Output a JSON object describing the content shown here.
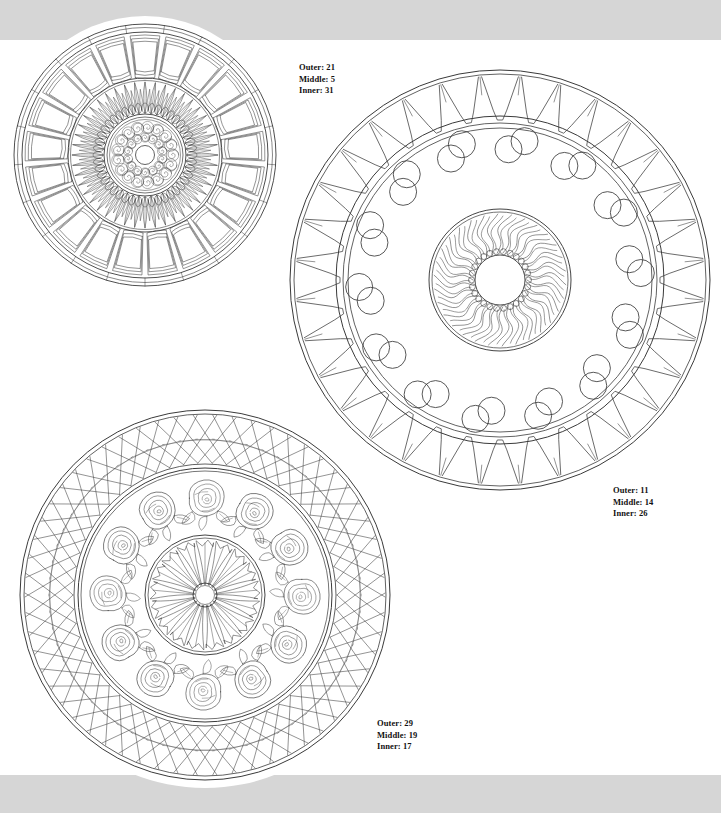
{
  "page": {
    "width": 721,
    "height": 813,
    "background_color": "#d6d6d6",
    "paper_color": "#ffffff",
    "ink_color": "#3a3a3a"
  },
  "mandalas": [
    {
      "id": "mandala-top-left",
      "position": {
        "x": 12,
        "y": 22,
        "size": 266
      },
      "style": "rosette-petal-arches",
      "rings": {
        "outer": {
          "count": 21,
          "motif": "rounded-arch-petals"
        },
        "middle": {
          "count": 5,
          "motif": "radiating-leaf-flames"
        },
        "inner": {
          "count": 31,
          "motif": "spiral-scrolls"
        }
      },
      "label": {
        "outer_label": "Outer: 21",
        "middle_label": "Middle: 5",
        "inner_label": "Inner: 31"
      }
    },
    {
      "id": "mandala-top-right",
      "position": {
        "x": 288,
        "y": 68,
        "size": 424
      },
      "style": "sunburst-wedge-circles",
      "rings": {
        "outer": {
          "count": 11,
          "motif": "tapered-wedge-teeth"
        },
        "middle": {
          "count": 14,
          "motif": "paired-circles"
        },
        "inner": {
          "count": 26,
          "motif": "wavy-flame-rays-with-beads"
        }
      },
      "label": {
        "outer_label": "Outer: 11",
        "middle_label": "Middle: 14",
        "inner_label": "Inner: 26"
      }
    },
    {
      "id": "mandala-bottom-left",
      "position": {
        "x": 18,
        "y": 408,
        "size": 374
      },
      "style": "rose-garland-lattice",
      "rings": {
        "outer": {
          "count": 29,
          "motif": "crisscross-zigzag-lattice"
        },
        "middle": {
          "count": 19,
          "motif": "roses-with-leaves"
        },
        "inner": {
          "count": 17,
          "motif": "jagged-radiating-petals"
        }
      },
      "label": {
        "outer_label": "Outer: 29",
        "middle_label": "Middle: 19",
        "inner_label": "Inner: 17"
      }
    }
  ],
  "labels": {
    "mandala_1": {
      "outer": "Outer: 21",
      "middle": "Middle: 5",
      "inner": "Inner: 31"
    },
    "mandala_2": {
      "outer": "Outer: 11",
      "middle": "Middle: 14",
      "inner": "Inner: 26"
    },
    "mandala_3": {
      "outer": "Outer: 29",
      "middle": "Middle: 19",
      "inner": "Inner: 17"
    }
  }
}
